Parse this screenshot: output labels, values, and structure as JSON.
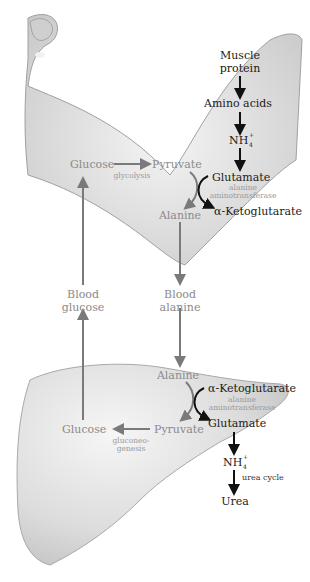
{
  "diagram": {
    "regions": {
      "muscle": {
        "shape": "arm-illustration"
      },
      "liver": {
        "shape": "liver-illustration"
      }
    },
    "muscle": {
      "muscle_protein": [
        "Muscle",
        "protein"
      ],
      "amino_acids": "Amino acids",
      "nh4": "NH",
      "nh4_sup": "+",
      "nh4_sub": "4",
      "glutamate": "Glutamate",
      "enzyme": [
        "alanine",
        "aminotransferase"
      ],
      "alpha_ketoglutarate": "α-Ketoglutarate",
      "glucose": "Glucose",
      "pyruvate": "Pyruvate",
      "glycolysis": "glycolysis",
      "alanine": "Alanine"
    },
    "blood": {
      "blood_glucose": [
        "Blood",
        "glucose"
      ],
      "blood_alanine": [
        "Blood",
        "alanine"
      ]
    },
    "liver": {
      "alanine": "Alanine",
      "alpha_ketoglutarate": "α-Ketoglutarate",
      "enzyme": [
        "alanine",
        "aminotransferase"
      ],
      "glutamate": "Glutamate",
      "pyruvate": "Pyruvate",
      "glucose": "Glucose",
      "gluconeogenesis": [
        "gluconeo-",
        "genesis"
      ],
      "nh4": "NH",
      "nh4_sup": "+",
      "nh4_sub": "4",
      "urea_cycle": "urea cycle",
      "urea": "Urea"
    },
    "colors": {
      "dark_arrow": "#111111",
      "grey_arrow": "#7a7a7a",
      "organ_fill": "#d9d9d9",
      "organ_edge": "#9a9a9a"
    }
  }
}
